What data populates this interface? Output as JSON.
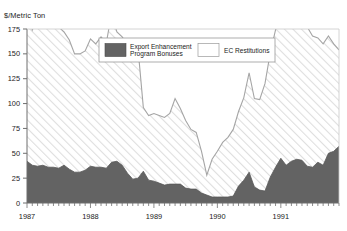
{
  "chart_data": {
    "type": "area",
    "title": "",
    "ylabel": "$/Metric Ton",
    "xlabel": "",
    "ylim": [
      0,
      175
    ],
    "yticks": [
      0,
      25,
      50,
      75,
      100,
      125,
      150,
      175
    ],
    "xtick_labels": [
      "1987",
      "1988",
      "1989",
      "1990",
      "1991"
    ],
    "grid": false,
    "legend_position": "top-center",
    "stacked": true,
    "x": [
      "1987-01",
      "1987-02",
      "1987-03",
      "1987-04",
      "1987-05",
      "1987-06",
      "1987-07",
      "1987-08",
      "1987-09",
      "1987-10",
      "1987-11",
      "1987-12",
      "1988-01",
      "1988-02",
      "1988-03",
      "1988-04",
      "1988-05",
      "1988-06",
      "1988-07",
      "1988-08",
      "1988-09",
      "1988-10",
      "1988-11",
      "1988-12",
      "1989-01",
      "1989-02",
      "1989-03",
      "1989-04",
      "1989-05",
      "1989-06",
      "1989-07",
      "1989-08",
      "1989-09",
      "1989-10",
      "1989-11",
      "1989-12",
      "1990-01",
      "1990-02",
      "1990-03",
      "1990-04",
      "1990-05",
      "1990-06",
      "1990-07",
      "1990-08",
      "1990-09",
      "1990-10",
      "1990-11",
      "1990-12",
      "1991-01",
      "1991-02",
      "1991-03",
      "1991-04",
      "1991-05",
      "1991-06",
      "1991-07",
      "1991-08",
      "1991-09",
      "1991-10",
      "1991-11",
      "1991-12"
    ],
    "series": [
      {
        "name": "Export Enhancement Program Bonuses",
        "color": "#636363",
        "values": [
          42,
          38,
          37,
          38,
          36,
          36,
          35,
          38,
          34,
          31,
          31,
          33,
          37,
          36,
          36,
          35,
          41,
          42,
          38,
          30,
          24,
          25,
          32,
          23,
          22,
          20,
          18,
          19,
          19,
          19,
          15,
          14,
          14,
          10,
          8,
          6,
          6,
          6,
          6,
          7,
          17,
          23,
          31,
          16,
          13,
          12,
          26,
          36,
          45,
          38,
          42,
          44,
          43,
          37,
          36,
          41,
          38,
          50,
          52,
          57
        ]
      },
      {
        "name": "EC Restitutions",
        "color": "#ffffff",
        "values": [
          155,
          136,
          149,
          156,
          155,
          150,
          142,
          134,
          130,
          119,
          119,
          120,
          128,
          124,
          131,
          126,
          150,
          130,
          129,
          129,
          131,
          130,
          64,
          65,
          68,
          68,
          68,
          71,
          86,
          76,
          68,
          60,
          57,
          42,
          20,
          38,
          46,
          55,
          60,
          67,
          75,
          83,
          100,
          89,
          91,
          108,
          125,
          138,
          152,
          155,
          154,
          161,
          158,
          140,
          132,
          125,
          122,
          118,
          108,
          97
        ]
      }
    ]
  },
  "legend": {
    "items": [
      {
        "label_line1": "Export Enhancement",
        "label_line2": "Program Bonuses",
        "swatch": "dark"
      },
      {
        "label_line1": "EC Restitutions",
        "label_line2": "",
        "swatch": "light"
      }
    ]
  },
  "colors": {
    "series_dark": "#636363",
    "series_light": "#ffffff",
    "hatch": "#d8d8d8",
    "axis": "#6e6e6e",
    "line": "#9a9a9a",
    "text": "#1b1b1b",
    "background": "#ffffff"
  }
}
